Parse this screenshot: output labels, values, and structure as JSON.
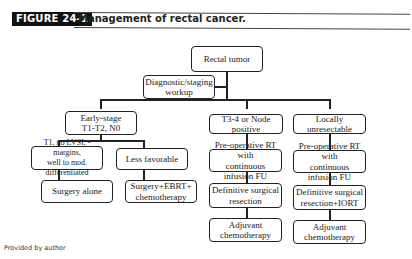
{
  "figure": {
    "label": "FIGURE 24-1",
    "title": "Management of rectal cancer."
  },
  "nodes": {
    "root": "Rectal tumor",
    "workup": "Diagnostic/staging\nworkup",
    "early": "Early-stage\nT1-T2, N0",
    "t34": "T3-4 or Node positive",
    "unresectable": "Locally unresectable",
    "t1": "T1, no LVSI, - margins,\nwell to mod. differentiated",
    "less_fav": "Less favorable",
    "surgery_alone": "Surgery alone",
    "surgery_ebrt": "Surgery+EBRT+\nchemotherapy",
    "t34_preop": "Pre-operative RT with\ncontinuous infusion FU",
    "t34_resection": "Definitive surgical\nresection",
    "t34_adjuvant": "Adjuvant\nchemotherapy",
    "lu_preop": "Pre-operative RT with\ncontinuous infusion FU",
    "lu_resection": "Definitive surgical\nresection+IORT",
    "lu_adjuvant": "Adjuvant\nchemotherapy"
  },
  "footer": "Provided by author"
}
